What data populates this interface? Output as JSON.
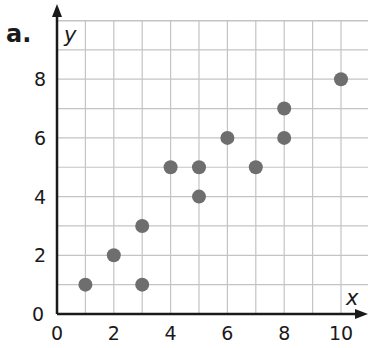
{
  "part_label": "a.",
  "chart_data": {
    "type": "scatter",
    "title": "",
    "xlabel": "x",
    "ylabel": "y",
    "xlim": [
      0,
      11
    ],
    "ylim": [
      0,
      10
    ],
    "grid": true,
    "x_ticks": [
      0,
      2,
      4,
      6,
      8,
      10
    ],
    "y_ticks": [
      0,
      2,
      4,
      6,
      8
    ],
    "x": [
      1,
      2,
      3,
      3,
      4,
      5,
      5,
      6,
      7,
      8,
      8,
      10
    ],
    "y": [
      1,
      2,
      1,
      3,
      5,
      5,
      4,
      6,
      5,
      6,
      7,
      8
    ],
    "marker_color": "#6e6e6e",
    "grid_color": "#c4c4c4",
    "axis_color": "#1a1a1a"
  }
}
